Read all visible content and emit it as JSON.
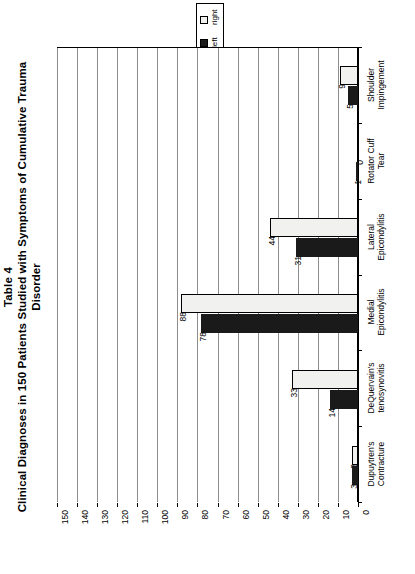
{
  "title": {
    "line1": "Table 4",
    "line2": "Clinical Diagnoses in 150 Patients Studied with Symptoms of Cumulative Trauma",
    "line3": "Disorder"
  },
  "legend": {
    "items": [
      {
        "label": "right",
        "color": "#f1f1ef"
      },
      {
        "label": "left",
        "color": "#1a1a1a"
      }
    ]
  },
  "chart_data": {
    "type": "bar",
    "orientation": "horizontal",
    "title": "Clinical Diagnoses in 150 Patients Studied with Symptoms of Cumulative Trauma Disorder",
    "xlabel": "",
    "ylabel": "",
    "xlim": [
      0,
      150
    ],
    "xticks": [
      0,
      10,
      20,
      30,
      40,
      50,
      60,
      70,
      80,
      90,
      100,
      110,
      120,
      130,
      140,
      150
    ],
    "xticklabels": [
      "0",
      "10",
      "20",
      "30",
      "40",
      "50",
      "60",
      "70",
      "80",
      "90",
      "100",
      "110",
      "120",
      "130",
      "140",
      "150"
    ],
    "grid": true,
    "legend_position": "top-center",
    "categories": [
      "Shoulder Impingement",
      "Rotator Cuff Tear",
      "Lateral Epicondylitis",
      "Medial Epicondylitis",
      "DeQuervain's tenosynovitis",
      "Dupuytren's Contracture"
    ],
    "category_lines": [
      [
        "Shoulder",
        "Impingement"
      ],
      [
        "Rotator Cuff",
        "Tear"
      ],
      [
        "Lateral",
        "Epicondylitis"
      ],
      [
        "Medial",
        "Epicondylitis"
      ],
      [
        "DeQuervain's",
        "tenosynovitis"
      ],
      [
        "Dupuytren's",
        "Contracture"
      ]
    ],
    "series": [
      {
        "name": "right",
        "color": "#f1f1ef",
        "values": [
          9,
          0,
          44,
          88,
          33,
          3
        ]
      },
      {
        "name": "left",
        "color": "#1a1a1a",
        "values": [
          5,
          1,
          31,
          78,
          14,
          3
        ]
      }
    ]
  }
}
